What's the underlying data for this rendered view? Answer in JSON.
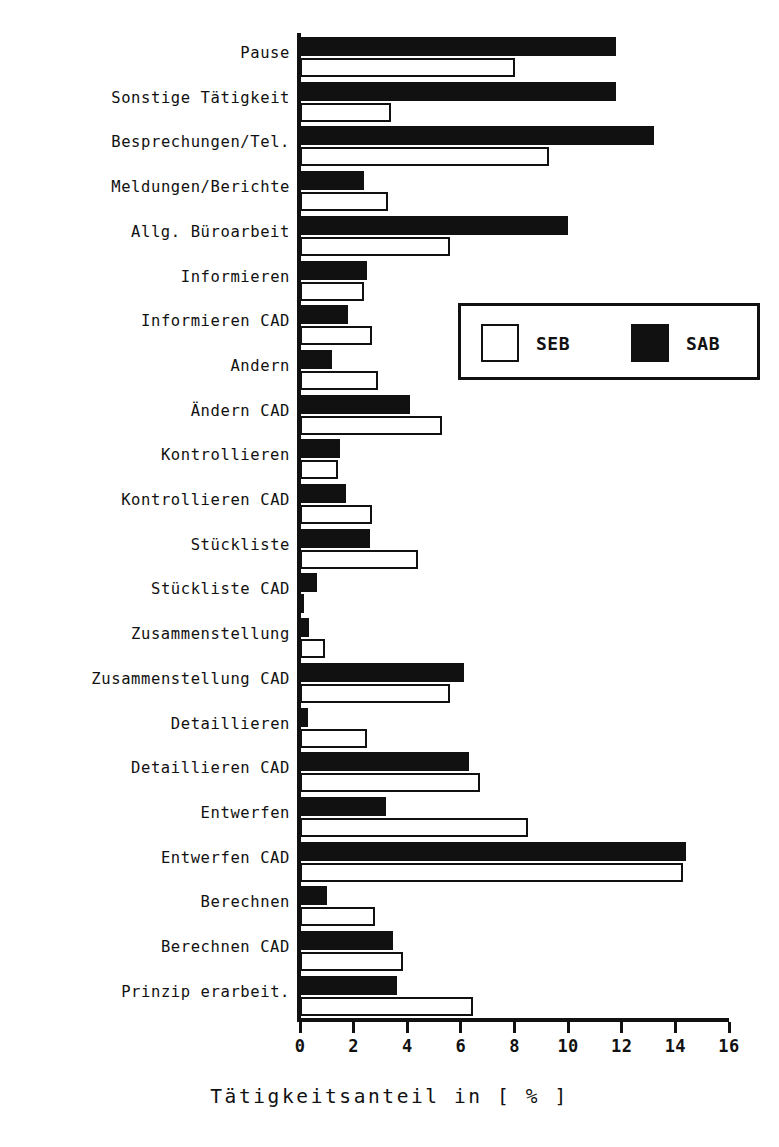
{
  "chart_data": {
    "type": "bar",
    "orientation": "horizontal",
    "title": "",
    "xlabel": "Tätigkeitsanteil in [ % ]",
    "ylabel": "",
    "xlim": [
      0,
      16
    ],
    "xticks": [
      0,
      2,
      4,
      6,
      8,
      10,
      12,
      14,
      16
    ],
    "xtick_labels": [
      "0",
      "2",
      "4",
      "6",
      "8",
      "10",
      "12",
      "14",
      "16"
    ],
    "grid": false,
    "legend_position": "center-right",
    "categories": [
      "Pause",
      "Sonstige Tätigkeit",
      "Besprechungen/Tel.",
      "Meldungen/Berichte",
      "Allg. Büroarbeit",
      "Informieren",
      "Informieren CAD",
      "Andern",
      "Ändern CAD",
      "Kontrollieren",
      "Kontrollieren CAD",
      "Stückliste",
      "Stückliste CAD",
      "Zusammenstellung",
      "Zusammenstellung CAD",
      "Detaillieren",
      "Detaillieren CAD",
      "Entwerfen",
      "Entwerfen CAD",
      "Berechnen",
      "Berechnen CAD",
      "Prinzip erarbeit."
    ],
    "series": [
      {
        "name": "SAB",
        "color": "#111111",
        "style": "filled",
        "values": [
          11.8,
          11.8,
          13.2,
          2.4,
          10.0,
          2.5,
          1.8,
          1.2,
          4.1,
          1.5,
          1.7,
          2.6,
          0.65,
          0.35,
          6.1,
          0.3,
          6.3,
          3.2,
          14.4,
          1.0,
          3.45,
          3.6
        ]
      },
      {
        "name": "SEB",
        "color": "#ffffff",
        "style": "outlined",
        "values": [
          8.0,
          3.4,
          9.3,
          3.3,
          5.6,
          2.4,
          2.7,
          2.9,
          5.3,
          1.4,
          2.7,
          4.4,
          0.15,
          0.95,
          5.6,
          2.5,
          6.7,
          8.5,
          14.3,
          2.8,
          3.85,
          6.45
        ]
      }
    ]
  },
  "legend": {
    "entries": [
      {
        "label": "SEB",
        "swatch": "white"
      },
      {
        "label": "SAB",
        "swatch": "black"
      }
    ]
  }
}
